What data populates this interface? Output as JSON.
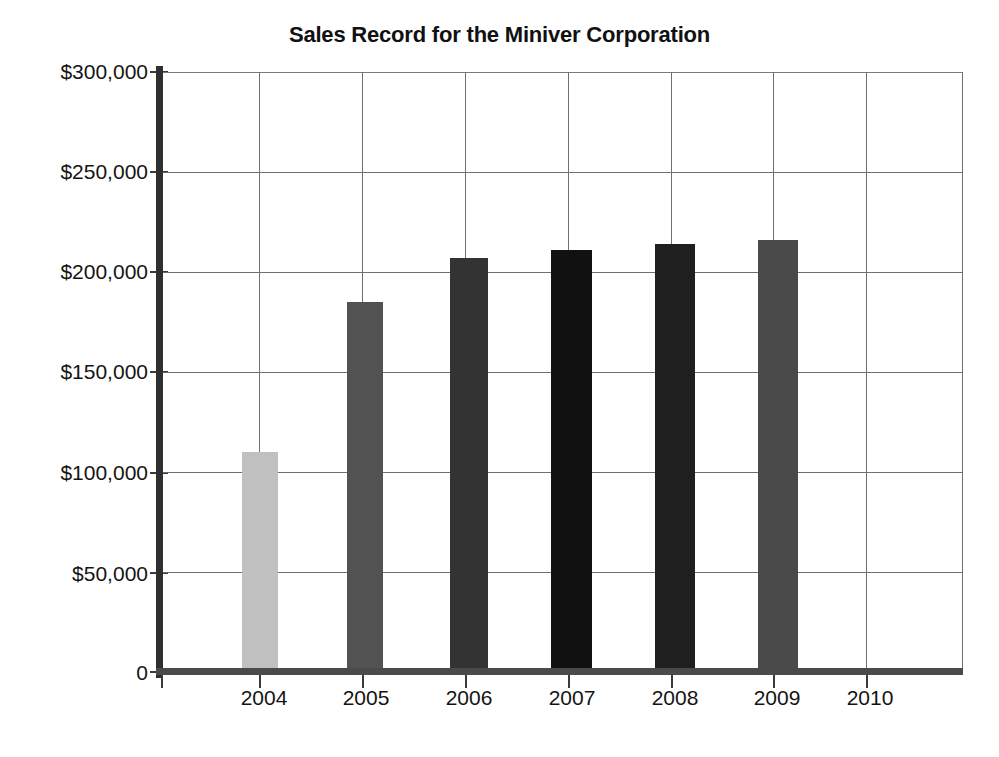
{
  "chart_data": {
    "type": "bar",
    "title": "Sales Record for the Miniver Corporation",
    "xlabel": "",
    "ylabel": "",
    "categories": [
      "2004",
      "2005",
      "2006",
      "2007",
      "2008",
      "2009",
      "2010"
    ],
    "values": [
      110000,
      185000,
      207000,
      211000,
      214000,
      216000,
      null
    ],
    "ylim": [
      0,
      300000
    ],
    "ytick_values": [
      0,
      50000,
      100000,
      150000,
      200000,
      250000,
      300000
    ],
    "ytick_labels": [
      "0",
      "$50,000",
      "$100,000",
      "$150,000",
      "$200,000",
      "$250,000",
      "$300,000"
    ],
    "grid": true,
    "legend": "none",
    "series": [
      {
        "name": "Sales",
        "values": [
          110000,
          185000,
          207000,
          211000,
          214000,
          216000,
          null
        ],
        "bar_colors": [
          "#c0c0c0",
          "#525252",
          "#333333",
          "#111111",
          "#1f1f1f",
          "#4a4a4a",
          "none"
        ]
      }
    ]
  },
  "colors": {
    "background": "#ffffff",
    "axis": "#2f2f2f",
    "gridline": "#707070",
    "text": "#141414",
    "bar_2004": "#c0c0c0",
    "bar_2005": "#525252",
    "bar_2006": "#333333",
    "bar_2007": "#111111",
    "bar_2008": "#1f1f1f",
    "bar_2009": "#4a4a4a"
  }
}
